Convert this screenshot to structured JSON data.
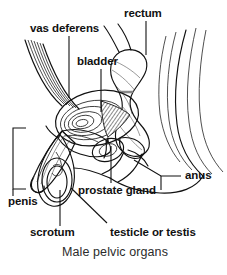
{
  "figure": {
    "title": "Male pelvic organs",
    "type": "anatomical-line-diagram",
    "view": "sagittal section",
    "background_color": "#ffffff",
    "ink_color": "#111111",
    "labels": [
      {
        "id": "vas-deferens",
        "text": "vas deferens",
        "x": 30,
        "y": 32,
        "anchor": "start"
      },
      {
        "id": "rectum",
        "text": "rectum",
        "x": 124,
        "y": 17,
        "anchor": "start"
      },
      {
        "id": "bladder",
        "text": "bladder",
        "x": 77,
        "y": 65,
        "anchor": "start"
      },
      {
        "id": "anus",
        "text": "anus",
        "x": 185,
        "y": 179,
        "anchor": "start"
      },
      {
        "id": "prostate-gland",
        "text": "prostate gland",
        "x": 78,
        "y": 194,
        "anchor": "start"
      },
      {
        "id": "penis",
        "text": "penis",
        "x": 8,
        "y": 205,
        "anchor": "start"
      },
      {
        "id": "scrotum",
        "text": "scrotum",
        "x": 30,
        "y": 236,
        "anchor": "start"
      },
      {
        "id": "testicle-or-testis",
        "text": "testicle or testis",
        "x": 110,
        "y": 236,
        "anchor": "start"
      }
    ],
    "caption": {
      "text": "Male pelvic organs",
      "x": 62,
      "y": 256
    }
  }
}
